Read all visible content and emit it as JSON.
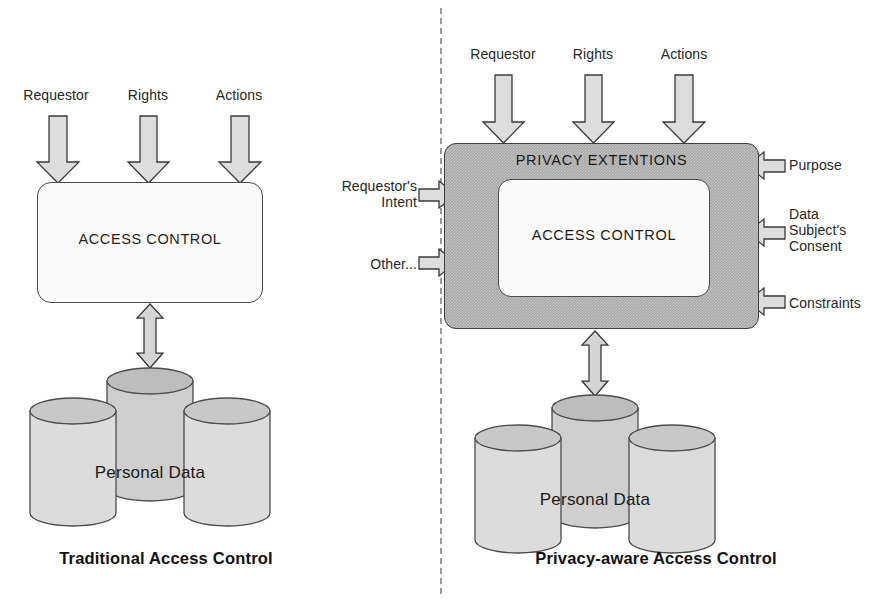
{
  "figure": {
    "divider": "dashed-vertical"
  },
  "colors": {
    "privacy_box_fill": "#a9a9a9",
    "access_box_fill": "#fafafa",
    "cylinder_fill": "#dcdcdc",
    "cylinder_top": "#c8c8c8",
    "arrow_fill": "#dddddd",
    "outline": "#4a4a4a",
    "text": "#1a1a1a"
  },
  "left_panel": {
    "caption": "Traditional Access Control",
    "inputs": [
      {
        "label": "Requestor",
        "arrow": "down-arrow"
      },
      {
        "label": "Rights",
        "arrow": "down-arrow"
      },
      {
        "label": "Actions",
        "arrow": "down-arrow"
      }
    ],
    "box": {
      "label": "ACCESS CONTROL"
    },
    "link_arrow": "double-headed-vertical-arrow",
    "datastore": {
      "label": "Personal Data",
      "cylinders": 3
    }
  },
  "right_panel": {
    "caption": "Privacy-aware Access Control",
    "inputs_top": [
      {
        "label": "Requestor",
        "arrow": "down-arrow"
      },
      {
        "label": "Rights",
        "arrow": "down-arrow"
      },
      {
        "label": "Actions",
        "arrow": "down-arrow"
      }
    ],
    "inputs_left": [
      {
        "label": "Requestor's\nIntent",
        "arrow": "right-arrow"
      },
      {
        "label": "Other...",
        "arrow": "right-arrow"
      }
    ],
    "inputs_right": [
      {
        "label": "Purpose",
        "arrow": "left-arrow"
      },
      {
        "label": "Data\nSubject's\nConsent",
        "arrow": "left-arrow"
      },
      {
        "label": "Constraints",
        "arrow": "left-arrow"
      }
    ],
    "outer_box": {
      "label": "PRIVACY EXTENTIONS"
    },
    "inner_box": {
      "label": "ACCESS CONTROL"
    },
    "link_arrow": "double-headed-vertical-arrow",
    "datastore": {
      "label": "Personal Data",
      "cylinders": 3
    }
  }
}
